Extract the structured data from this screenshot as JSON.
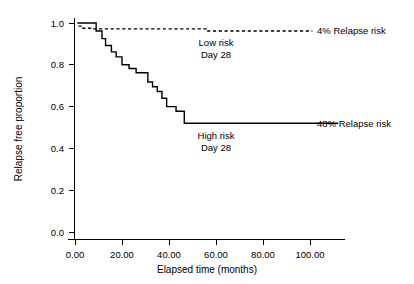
{
  "chart_data": {
    "type": "line",
    "title": "",
    "xlabel": "Elapsed time (months)",
    "ylabel": "Relapse free proportion",
    "xlim": [
      -5,
      112
    ],
    "ylim": [
      0.0,
      1.06
    ],
    "xticks": [
      "0.00",
      "20.00",
      "40.00",
      "60.00",
      "80.00",
      "100.00"
    ],
    "xtick_values": [
      0,
      20,
      40,
      60,
      80,
      100
    ],
    "yticks": [
      "0.0",
      "0.2",
      "0.4",
      "0.6",
      "0.8",
      "1.0"
    ],
    "ytick_values": [
      0.0,
      0.2,
      0.4,
      0.6,
      0.8,
      1.0
    ],
    "grid": false,
    "legend": "none",
    "series": [
      {
        "name": "Low risk",
        "style": "dashed",
        "color": "#000000",
        "x": [
          1.5,
          3.0,
          3.0,
          8.0,
          8.0,
          56.0,
          56.0,
          101.0
        ],
        "y": [
          0.985,
          0.985,
          0.975,
          0.975,
          0.972,
          0.972,
          0.962,
          0.962
        ]
      },
      {
        "name": "High risk",
        "style": "solid",
        "color": "#000000",
        "x": [
          1.0,
          9.0,
          9.0,
          11.5,
          11.5,
          13.0,
          13.0,
          15.5,
          15.5,
          17.5,
          17.5,
          20.0,
          20.0,
          23.0,
          23.0,
          26.0,
          26.0,
          31.0,
          31.0,
          33.0,
          33.0,
          35.0,
          35.0,
          37.0,
          37.0,
          39.0,
          39.0,
          43.0,
          43.0,
          46.5,
          46.5,
          112.0
        ],
        "y": [
          1.0,
          1.0,
          0.962,
          0.962,
          0.925,
          0.925,
          0.892,
          0.892,
          0.862,
          0.862,
          0.838,
          0.838,
          0.8,
          0.8,
          0.782,
          0.782,
          0.762,
          0.762,
          0.718,
          0.718,
          0.695,
          0.695,
          0.672,
          0.672,
          0.64,
          0.64,
          0.6,
          0.6,
          0.578,
          0.578,
          0.52,
          0.52
        ]
      }
    ],
    "annotations": [
      {
        "name": "low-risk-relapse-label",
        "text": "4% Relapse risk",
        "x": 103,
        "y": 0.962
      },
      {
        "name": "low-risk-group-label",
        "text": "Low risk",
        "x": 60,
        "y": 0.905
      },
      {
        "name": "low-risk-day-label",
        "text": "Day 28",
        "x": 60,
        "y": 0.848
      },
      {
        "name": "high-risk-relapse-label",
        "text": "48% Relapse risk",
        "x": 103,
        "y": 0.52
      },
      {
        "name": "high-risk-group-label",
        "text": "High risk",
        "x": 60,
        "y": 0.462
      },
      {
        "name": "high-risk-day-label",
        "text": "Day 28",
        "x": 60,
        "y": 0.405
      }
    ]
  }
}
